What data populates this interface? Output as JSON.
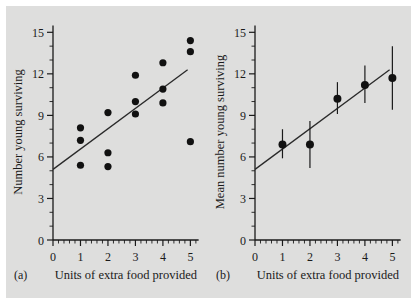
{
  "figure": {
    "background_color": "#dededd",
    "ink_color": "#1a1a1a"
  },
  "chart_data": [
    {
      "type": "scatter",
      "panel_label": "(a)",
      "title": "",
      "xlabel": "Units of extra food provided",
      "ylabel": "Number young surviving",
      "xlim": [
        0,
        5.35
      ],
      "ylim": [
        0,
        15.6
      ],
      "xticks": [
        0,
        1,
        2,
        3,
        4,
        5
      ],
      "xticklabels": [
        "0",
        "1",
        "2",
        "3",
        "4",
        "5"
      ],
      "yticks": [
        0,
        3,
        6,
        9,
        12,
        15
      ],
      "yticklabels": [
        "0",
        "3",
        "6",
        "9",
        "12",
        "15"
      ],
      "x_minor_interval": 0.2,
      "y_minor_interval": 1,
      "grid": false,
      "legend": "none",
      "points": [
        {
          "x": 1,
          "y": 8.1
        },
        {
          "x": 1,
          "y": 7.2
        },
        {
          "x": 1,
          "y": 5.4
        },
        {
          "x": 2,
          "y": 9.2
        },
        {
          "x": 2,
          "y": 6.3
        },
        {
          "x": 2,
          "y": 5.3
        },
        {
          "x": 3,
          "y": 11.9
        },
        {
          "x": 3,
          "y": 10.0
        },
        {
          "x": 3,
          "y": 9.1
        },
        {
          "x": 4,
          "y": 12.8
        },
        {
          "x": 4,
          "y": 10.9
        },
        {
          "x": 4,
          "y": 9.9
        },
        {
          "x": 5,
          "y": 14.4
        },
        {
          "x": 5,
          "y": 13.6
        },
        {
          "x": 5,
          "y": 7.1
        }
      ],
      "fit_line": {
        "x0": 0.0,
        "y0": 5.1,
        "x1": 4.9,
        "y1": 12.3
      }
    },
    {
      "type": "scatter",
      "panel_label": "(b)",
      "title": "",
      "xlabel": "Units of extra food provided",
      "ylabel": "Mean number young surviving",
      "xlim": [
        0,
        5.35
      ],
      "ylim": [
        0,
        15.6
      ],
      "xticks": [
        0,
        1,
        2,
        3,
        4,
        5
      ],
      "xticklabels": [
        "0",
        "1",
        "2",
        "3",
        "4",
        "5"
      ],
      "yticks": [
        0,
        3,
        6,
        9,
        12,
        15
      ],
      "yticklabels": [
        "0",
        "3",
        "6",
        "9",
        "12",
        "15"
      ],
      "x_minor_interval": 0.2,
      "y_minor_interval": 1,
      "grid": false,
      "legend": "none",
      "error_bars": true,
      "points": [
        {
          "x": 1,
          "y": 6.9,
          "err_low": 5.9,
          "err_high": 8.0
        },
        {
          "x": 2,
          "y": 6.9,
          "err_low": 5.2,
          "err_high": 8.6
        },
        {
          "x": 3,
          "y": 10.2,
          "err_low": 9.1,
          "err_high": 11.4
        },
        {
          "x": 4,
          "y": 11.2,
          "err_low": 9.9,
          "err_high": 12.6
        },
        {
          "x": 5,
          "y": 11.7,
          "err_low": 9.4,
          "err_high": 14.0
        }
      ],
      "fit_line": {
        "x0": 0.0,
        "y0": 5.1,
        "x1": 4.9,
        "y1": 12.3
      }
    }
  ]
}
